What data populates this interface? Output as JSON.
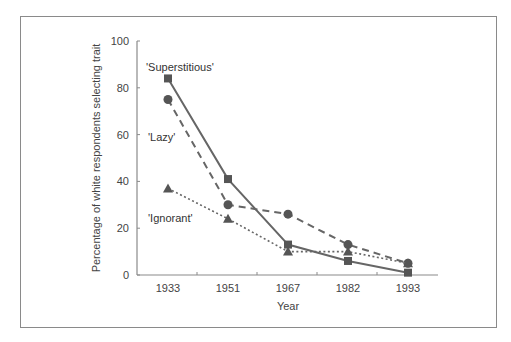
{
  "chart_data": {
    "type": "line",
    "title": "",
    "xlabel": "Year",
    "ylabel": "Percentage of white respondents selecting trait",
    "categories": [
      "1933",
      "1951",
      "1967",
      "1982",
      "1993"
    ],
    "ylim": [
      0,
      100
    ],
    "yticks": [
      "0",
      "20",
      "40",
      "60",
      "80",
      "100"
    ],
    "grid": false,
    "legend": "inline labels",
    "series": [
      {
        "name": "'Superstitious'",
        "style": "solid",
        "marker": "square",
        "values": [
          84,
          41,
          13,
          6,
          1
        ]
      },
      {
        "name": "'Lazy'",
        "style": "dashed",
        "marker": "circle",
        "values": [
          75,
          30,
          26,
          13,
          5
        ]
      },
      {
        "name": "'Ignorant'",
        "style": "dotted",
        "marker": "triangle",
        "values": [
          37,
          24,
          10,
          10,
          5
        ]
      }
    ],
    "colors": {
      "line": "#666666",
      "marker": "#555555",
      "axis": "#8a8a8a"
    }
  }
}
